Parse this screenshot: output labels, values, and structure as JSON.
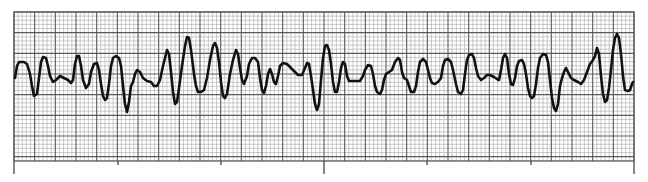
{
  "strip": {
    "type": "ecg-rhythm-strip",
    "paper": {
      "left": 14,
      "top": 12,
      "right": 634,
      "bottom": 161,
      "minor_box_px": 4.13,
      "major_box_px": 20.67,
      "minor_color": "#a8a8a8",
      "major_color": "#5a5a5a"
    },
    "time_markers": [
      {
        "x": 14,
        "kind": "long"
      },
      {
        "x": 118,
        "kind": "short"
      },
      {
        "x": 221,
        "kind": "short"
      },
      {
        "x": 324,
        "kind": "long"
      },
      {
        "x": 427,
        "kind": "short"
      },
      {
        "x": 531,
        "kind": "short"
      },
      {
        "x": 634,
        "kind": "long"
      }
    ],
    "trace_color": "#111111",
    "trace_points": [
      [
        15,
        78
      ],
      [
        17,
        66
      ],
      [
        19,
        62
      ],
      [
        24,
        62
      ],
      [
        27,
        64
      ],
      [
        30,
        74
      ],
      [
        32,
        86
      ],
      [
        34,
        96
      ],
      [
        37,
        94
      ],
      [
        39,
        78
      ],
      [
        41,
        62
      ],
      [
        43,
        57
      ],
      [
        46,
        58
      ],
      [
        48,
        66
      ],
      [
        50,
        76
      ],
      [
        53,
        82
      ],
      [
        56,
        80
      ],
      [
        60,
        76
      ],
      [
        64,
        78
      ],
      [
        68,
        80
      ],
      [
        71,
        83
      ],
      [
        73,
        80
      ],
      [
        75,
        64
      ],
      [
        77,
        56
      ],
      [
        79,
        56
      ],
      [
        81,
        66
      ],
      [
        83,
        80
      ],
      [
        86,
        88
      ],
      [
        89,
        84
      ],
      [
        91,
        72
      ],
      [
        94,
        64
      ],
      [
        97,
        63
      ],
      [
        99,
        70
      ],
      [
        101,
        84
      ],
      [
        103,
        96
      ],
      [
        105,
        100
      ],
      [
        107,
        98
      ],
      [
        109,
        84
      ],
      [
        111,
        66
      ],
      [
        113,
        58
      ],
      [
        116,
        56
      ],
      [
        119,
        58
      ],
      [
        121,
        66
      ],
      [
        123,
        86
      ],
      [
        125,
        104
      ],
      [
        127,
        112
      ],
      [
        129,
        102
      ],
      [
        131,
        86
      ],
      [
        133,
        82
      ],
      [
        135,
        74
      ],
      [
        137,
        70
      ],
      [
        140,
        72
      ],
      [
        143,
        78
      ],
      [
        147,
        81
      ],
      [
        151,
        82
      ],
      [
        154,
        86
      ],
      [
        157,
        86
      ],
      [
        160,
        80
      ],
      [
        163,
        66
      ],
      [
        165,
        58
      ],
      [
        167,
        50
      ],
      [
        169,
        54
      ],
      [
        171,
        72
      ],
      [
        173,
        92
      ],
      [
        175,
        104
      ],
      [
        177,
        102
      ],
      [
        179,
        88
      ],
      [
        182,
        66
      ],
      [
        185,
        46
      ],
      [
        187,
        37
      ],
      [
        189,
        38
      ],
      [
        191,
        50
      ],
      [
        194,
        74
      ],
      [
        196,
        86
      ],
      [
        198,
        92
      ],
      [
        201,
        92
      ],
      [
        204,
        90
      ],
      [
        207,
        78
      ],
      [
        210,
        60
      ],
      [
        213,
        46
      ],
      [
        215,
        43
      ],
      [
        217,
        48
      ],
      [
        219,
        62
      ],
      [
        221,
        82
      ],
      [
        223,
        96
      ],
      [
        225,
        98
      ],
      [
        227,
        94
      ],
      [
        230,
        74
      ],
      [
        233,
        60
      ],
      [
        236,
        50
      ],
      [
        238,
        54
      ],
      [
        240,
        68
      ],
      [
        242,
        80
      ],
      [
        244,
        84
      ],
      [
        247,
        76
      ],
      [
        249,
        64
      ],
      [
        252,
        58
      ],
      [
        255,
        58
      ],
      [
        258,
        62
      ],
      [
        260,
        78
      ],
      [
        262,
        90
      ],
      [
        264,
        93
      ],
      [
        266,
        86
      ],
      [
        268,
        74
      ],
      [
        270,
        69
      ],
      [
        272,
        74
      ],
      [
        274,
        82
      ],
      [
        276,
        84
      ],
      [
        278,
        76
      ],
      [
        280,
        66
      ],
      [
        283,
        63
      ],
      [
        287,
        64
      ],
      [
        291,
        68
      ],
      [
        295,
        72
      ],
      [
        298,
        75
      ],
      [
        302,
        75
      ],
      [
        305,
        68
      ],
      [
        307,
        63
      ],
      [
        309,
        64
      ],
      [
        311,
        76
      ],
      [
        313,
        90
      ],
      [
        315,
        104
      ],
      [
        317,
        110
      ],
      [
        319,
        104
      ],
      [
        321,
        80
      ],
      [
        323,
        58
      ],
      [
        325,
        46
      ],
      [
        327,
        45
      ],
      [
        329,
        50
      ],
      [
        331,
        64
      ],
      [
        333,
        82
      ],
      [
        335,
        92
      ],
      [
        337,
        92
      ],
      [
        339,
        82
      ],
      [
        341,
        68
      ],
      [
        343,
        62
      ],
      [
        345,
        64
      ],
      [
        347,
        76
      ],
      [
        349,
        81
      ],
      [
        352,
        81
      ],
      [
        356,
        81
      ],
      [
        360,
        81
      ],
      [
        363,
        76
      ],
      [
        365,
        70
      ],
      [
        368,
        65
      ],
      [
        371,
        66
      ],
      [
        373,
        74
      ],
      [
        375,
        86
      ],
      [
        377,
        92
      ],
      [
        380,
        94
      ],
      [
        382,
        90
      ],
      [
        384,
        80
      ],
      [
        386,
        74
      ],
      [
        389,
        72
      ],
      [
        392,
        70
      ],
      [
        395,
        62
      ],
      [
        398,
        58
      ],
      [
        400,
        60
      ],
      [
        402,
        72
      ],
      [
        404,
        78
      ],
      [
        407,
        80
      ],
      [
        409,
        86
      ],
      [
        411,
        92
      ],
      [
        414,
        92
      ],
      [
        416,
        86
      ],
      [
        418,
        72
      ],
      [
        420,
        62
      ],
      [
        423,
        59
      ],
      [
        426,
        62
      ],
      [
        428,
        70
      ],
      [
        430,
        78
      ],
      [
        432,
        83
      ],
      [
        435,
        84
      ],
      [
        438,
        82
      ],
      [
        441,
        78
      ],
      [
        443,
        66
      ],
      [
        445,
        60
      ],
      [
        448,
        59
      ],
      [
        451,
        62
      ],
      [
        453,
        70
      ],
      [
        456,
        84
      ],
      [
        458,
        92
      ],
      [
        461,
        94
      ],
      [
        463,
        90
      ],
      [
        465,
        74
      ],
      [
        467,
        60
      ],
      [
        469,
        55
      ],
      [
        472,
        54
      ],
      [
        474,
        58
      ],
      [
        476,
        68
      ],
      [
        478,
        76
      ],
      [
        481,
        80
      ],
      [
        484,
        78
      ],
      [
        487,
        75
      ],
      [
        490,
        75
      ],
      [
        494,
        77
      ],
      [
        497,
        79
      ],
      [
        499,
        80
      ],
      [
        501,
        70
      ],
      [
        503,
        58
      ],
      [
        505,
        54
      ],
      [
        507,
        58
      ],
      [
        509,
        74
      ],
      [
        511,
        84
      ],
      [
        513,
        85
      ],
      [
        515,
        78
      ],
      [
        517,
        66
      ],
      [
        519,
        61
      ],
      [
        522,
        60
      ],
      [
        524,
        64
      ],
      [
        526,
        74
      ],
      [
        528,
        88
      ],
      [
        530,
        96
      ],
      [
        532,
        98
      ],
      [
        534,
        96
      ],
      [
        536,
        84
      ],
      [
        538,
        68
      ],
      [
        540,
        58
      ],
      [
        543,
        54
      ],
      [
        546,
        55
      ],
      [
        548,
        62
      ],
      [
        550,
        80
      ],
      [
        552,
        98
      ],
      [
        554,
        108
      ],
      [
        556,
        111
      ],
      [
        558,
        104
      ],
      [
        560,
        86
      ],
      [
        562,
        78
      ],
      [
        564,
        72
      ],
      [
        566,
        68
      ],
      [
        568,
        72
      ],
      [
        571,
        78
      ],
      [
        574,
        80
      ],
      [
        578,
        82
      ],
      [
        581,
        84
      ],
      [
        584,
        80
      ],
      [
        587,
        72
      ],
      [
        590,
        64
      ],
      [
        593,
        60
      ],
      [
        595,
        56
      ],
      [
        597,
        48
      ],
      [
        599,
        54
      ],
      [
        601,
        76
      ],
      [
        603,
        94
      ],
      [
        605,
        102
      ],
      [
        607,
        100
      ],
      [
        609,
        88
      ],
      [
        611,
        70
      ],
      [
        613,
        50
      ],
      [
        615,
        38
      ],
      [
        617,
        34
      ],
      [
        619,
        38
      ],
      [
        621,
        54
      ],
      [
        623,
        76
      ],
      [
        625,
        90
      ],
      [
        628,
        91
      ],
      [
        630,
        90
      ],
      [
        632,
        84
      ],
      [
        633,
        82
      ]
    ]
  }
}
